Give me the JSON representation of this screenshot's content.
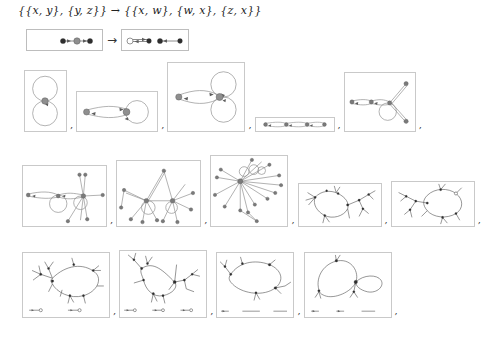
{
  "title": "{{x, y}, {y, z}} → {{x, w}, {w, x}, {z, x}}",
  "rule": {
    "lhs_label": "rule-lhs",
    "rhs_label": "rule-rhs",
    "arrow": "→",
    "lhs": {
      "nodes": [
        {
          "id": "x",
          "cx": 36,
          "cy": 11,
          "r": 2.6,
          "style": "dark"
        },
        {
          "id": "y",
          "cx": 50,
          "cy": 11,
          "r": 3.2,
          "style": "gray"
        },
        {
          "id": "z",
          "cx": 63,
          "cy": 11,
          "r": 2.6,
          "style": "dark"
        }
      ],
      "edges": [
        {
          "from": "x",
          "to": "y",
          "type": "directed"
        },
        {
          "from": "y",
          "to": "z",
          "type": "directed"
        }
      ]
    },
    "rhs": {
      "nodes": [
        {
          "id": "w",
          "cx": 8,
          "cy": 11,
          "r": 3.0,
          "style": "open"
        },
        {
          "id": "x",
          "cx": 27,
          "cy": 11,
          "r": 2.4,
          "style": "dark"
        },
        {
          "id": "x2",
          "cx": 38,
          "cy": 11,
          "r": 2.6,
          "style": "dark"
        },
        {
          "id": "z",
          "cx": 58,
          "cy": 11,
          "r": 2.4,
          "style": "dark"
        }
      ],
      "edges": [
        {
          "from": "x",
          "to": "w",
          "type": "directed"
        },
        {
          "from": "w",
          "to": "x",
          "type": "directed"
        },
        {
          "from": "z",
          "to": "x",
          "type": "directed"
        }
      ]
    }
  },
  "separator": ",",
  "rows": [
    {
      "name": "row-generations-1",
      "panels": [
        {
          "name": "graph-panel-step-1",
          "caption": "",
          "nodes": 1,
          "selfloops": 2,
          "edges": 2
        },
        {
          "name": "graph-panel-step-2",
          "caption": "",
          "nodes": 2,
          "selfloops": 1,
          "edges": 3
        },
        {
          "name": "graph-panel-step-3",
          "caption": "",
          "nodes": 2,
          "selfloops": 2,
          "edges": 4
        },
        {
          "name": "graph-panel-step-4",
          "caption": "",
          "nodes": 4,
          "selfloops": 0,
          "edges": 6
        },
        {
          "name": "graph-panel-step-5",
          "caption": "",
          "nodes": 5,
          "selfloops": 1,
          "edges": 8
        }
      ]
    },
    {
      "name": "row-generations-2",
      "panels": [
        {
          "name": "graph-panel-step-6",
          "caption": "",
          "nodes": 8,
          "selfloops": 2,
          "edges": 13
        },
        {
          "name": "graph-panel-step-7",
          "caption": "",
          "nodes": 12,
          "selfloops": 2,
          "edges": 18
        },
        {
          "name": "graph-panel-step-8",
          "caption": "",
          "nodes": 16,
          "selfloops": 3,
          "edges": 24
        },
        {
          "name": "graph-panel-step-9",
          "caption": "",
          "nodes": 26,
          "selfloops": 0,
          "edges": 32
        },
        {
          "name": "graph-panel-step-10",
          "caption": "",
          "nodes": 34,
          "selfloops": 0,
          "edges": 42
        }
      ]
    },
    {
      "name": "row-generations-3",
      "panels": [
        {
          "name": "graph-panel-step-11",
          "caption": "",
          "nodes": 44,
          "selfloops": 0,
          "edges": 54,
          "fragments": 2
        },
        {
          "name": "graph-panel-step-12",
          "caption": "",
          "nodes": 56,
          "selfloops": 0,
          "edges": 68,
          "fragments": 3
        },
        {
          "name": "graph-panel-step-13",
          "caption": "",
          "nodes": 64,
          "selfloops": 0,
          "edges": 78,
          "fragments": 3
        },
        {
          "name": "graph-panel-step-14",
          "caption": "",
          "nodes": 72,
          "selfloops": 0,
          "edges": 88,
          "fragments": 3
        }
      ]
    }
  ],
  "colors": {
    "node_gray": "#8f8f8f",
    "node_dark": "#2e2e2e",
    "edge": "#8e8e8e",
    "panel_border": "#c9c9c9",
    "background": "#ffffff",
    "text": "#1a1a1a"
  }
}
